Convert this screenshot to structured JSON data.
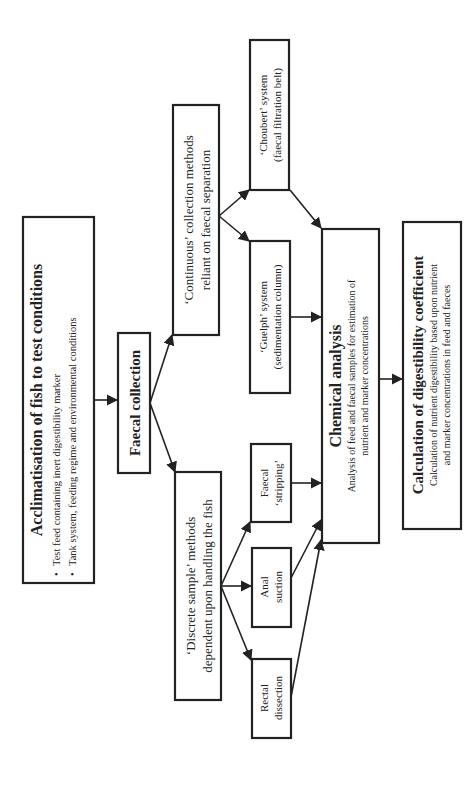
{
  "diagram": {
    "orientation": "rotated-90-ccw",
    "colors": {
      "line": "#222222",
      "background": "#ffffff"
    },
    "nodes": {
      "acclimatisation": {
        "title": "Acclimatisation of fish to test conditions",
        "bullets": [
          "Test feed containing inert digestibility marker",
          "Tank system, feeding regime and environmental conditions"
        ],
        "bullet_glyph": "•"
      },
      "faecal_collection": {
        "title": "Faecal collection"
      },
      "continuous": {
        "line1": "‘Continuous’ collection methods",
        "line2": "reliant on faecal separation"
      },
      "discrete": {
        "line1": "‘Discrete sample’ methods",
        "line2": "dependent upon handling the fish"
      },
      "choubert": {
        "line1": "‘Choubert’ system",
        "line2": "(faecal filtration belt)"
      },
      "guelph": {
        "line1": "‘Guelph’ system",
        "line2": "(sedimentation column)"
      },
      "stripping": {
        "line1": "Faecal",
        "line2": "‘stripping’"
      },
      "anal_suction": {
        "line1": "Anal",
        "line2": "suction"
      },
      "rectal_dissection": {
        "line1": "Rectal",
        "line2": "dissection"
      },
      "chemical_analysis": {
        "title": "Chemical analysis",
        "line1": "Analysis of feed and faecal samples for estimation of",
        "line2": "nutrient and marker concentrations"
      },
      "calculation": {
        "title": "Calculation of digestibility coefficient",
        "line1": "Calculation of nutrient digestibility based upon nutrient",
        "line2": "and marker concentrations in feed and faeces"
      }
    },
    "edges": [
      {
        "from": "acclimatisation",
        "to": "faecal_collection"
      },
      {
        "from": "faecal_collection",
        "to": "continuous"
      },
      {
        "from": "faecal_collection",
        "to": "discrete"
      },
      {
        "from": "continuous",
        "to": "choubert"
      },
      {
        "from": "continuous",
        "to": "guelph"
      },
      {
        "from": "discrete",
        "to": "stripping"
      },
      {
        "from": "discrete",
        "to": "anal_suction"
      },
      {
        "from": "discrete",
        "to": "rectal_dissection"
      },
      {
        "from": "choubert",
        "to": "chemical_analysis"
      },
      {
        "from": "guelph",
        "to": "chemical_analysis"
      },
      {
        "from": "stripping",
        "to": "chemical_analysis"
      },
      {
        "from": "anal_suction",
        "to": "chemical_analysis"
      },
      {
        "from": "rectal_dissection",
        "to": "chemical_analysis"
      },
      {
        "from": "chemical_analysis",
        "to": "calculation"
      }
    ]
  }
}
